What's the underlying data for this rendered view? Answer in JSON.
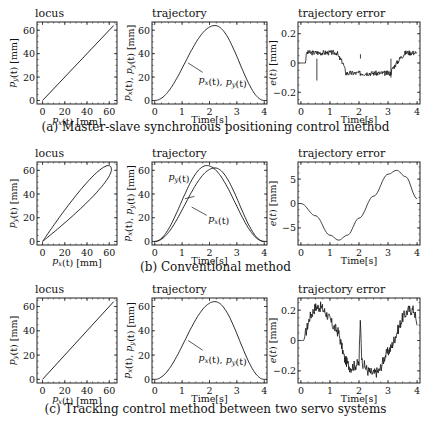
{
  "chart_data": [
    {
      "row": "a",
      "caption": "(a) Master-slave synchronous positioning control method",
      "panels": [
        {
          "type": "line",
          "title": "locus",
          "xlabel": "p_x(t) [mm]",
          "ylabel": "p_y(t) [mm]",
          "xlim": [
            -5,
            67
          ],
          "ylim": [
            -3,
            67
          ],
          "xticks": [
            0,
            20,
            40,
            60
          ],
          "yticks": [
            0,
            20,
            40,
            60
          ],
          "series": [
            {
              "name": "locus",
              "x": [
                0,
                64
              ],
              "y": [
                0,
                64
              ]
            }
          ]
        },
        {
          "type": "line",
          "title": "trajectory",
          "xlabel": "Time[s]",
          "ylabel": "p_x(t), p_y(t) [mm]",
          "xlim": [
            -0.1,
            4.1
          ],
          "ylim": [
            -3,
            67
          ],
          "xticks": [
            0,
            1,
            2,
            3,
            4
          ],
          "yticks": [
            0,
            20,
            40,
            60
          ],
          "annotation": "p_x(t), p_y(t)",
          "series": [
            {
              "name": "p_x(t), p_y(t)",
              "peak_time": 2.2,
              "peak_value": 64
            }
          ]
        },
        {
          "type": "line",
          "title": "trajectory error",
          "xlabel": "Time[s]",
          "ylabel": "e(t) [mm]",
          "xlim": [
            -0.1,
            4.1
          ],
          "ylim": [
            -0.28,
            0.28
          ],
          "xticks": [
            0,
            1,
            2,
            3,
            4
          ],
          "yticks": [
            -0.2,
            0,
            0.2
          ],
          "series": [
            {
              "name": "e(t)",
              "x": [
                0,
                0.15,
                0.2,
                1.25,
                1.3,
                1.45,
                1.55,
                3.1,
                3.15,
                3.3,
                3.45,
                3.6,
                4.0
              ],
              "y": [
                0,
                0,
                0.07,
                0.07,
                0.04,
                0,
                -0.07,
                -0.07,
                -0.04,
                0,
                0.04,
                0.07,
                0.07
              ]
            }
          ]
        }
      ]
    },
    {
      "row": "b",
      "caption": "(b) Conventional method",
      "panels": [
        {
          "type": "line",
          "title": "locus",
          "xlabel": "p_x(t) [mm]",
          "ylabel": "p_y(t) [mm]",
          "xlim": [
            -5,
            67
          ],
          "ylim": [
            -3,
            67
          ],
          "xticks": [
            0,
            20,
            40,
            60
          ],
          "yticks": [
            0,
            20,
            40,
            60
          ],
          "series": [
            {
              "name": "locus (ellipse loop)",
              "x": [
                0,
                64
              ],
              "y": [
                0,
                64
              ]
            }
          ]
        },
        {
          "type": "line",
          "title": "trajectory",
          "xlabel": "Time[s]",
          "ylabel": "p_x(t), p_y(t) [mm]",
          "xlim": [
            -0.1,
            4.1
          ],
          "ylim": [
            -3,
            67
          ],
          "xticks": [
            0,
            1,
            2,
            3,
            4
          ],
          "yticks": [
            0,
            20,
            40,
            60
          ],
          "annotations": [
            "p_y(t)",
            "p_x(t)"
          ],
          "series": [
            {
              "name": "p_y(t)",
              "peak_time": 1.9,
              "peak_value": 64
            },
            {
              "name": "p_x(t)",
              "peak_time": 2.2,
              "peak_value": 62
            }
          ]
        },
        {
          "type": "line",
          "title": "trajectory error",
          "xlabel": "Time[s]",
          "ylabel": "e(t) [mm]",
          "xlim": [
            -0.1,
            4.1
          ],
          "ylim": [
            -8.5,
            8.5
          ],
          "xticks": [
            0,
            1,
            2,
            3,
            4
          ],
          "yticks": [
            -5,
            0,
            5
          ],
          "series": [
            {
              "name": "e(t)",
              "x": [
                0,
                0.5,
                1.0,
                1.3,
                1.6,
                2.0,
                2.5,
                3.0,
                3.3,
                3.6,
                4.0
              ],
              "y": [
                0,
                -2.5,
                -6.5,
                -7.5,
                -6.5,
                -3,
                1.5,
                6,
                6.8,
                5.5,
                1
              ]
            }
          ]
        }
      ]
    },
    {
      "row": "c",
      "caption": "(c) Tracking control method between two servo systems",
      "panels": [
        {
          "type": "line",
          "title": "locus",
          "xlabel": "p_x(t) [mm]",
          "ylabel": "p_y(t) [mm]",
          "xlim": [
            -5,
            67
          ],
          "ylim": [
            -3,
            67
          ],
          "xticks": [
            0,
            20,
            40,
            60
          ],
          "yticks": [
            0,
            20,
            40,
            60
          ],
          "series": [
            {
              "name": "locus",
              "x": [
                0,
                64
              ],
              "y": [
                0,
                64
              ]
            }
          ]
        },
        {
          "type": "line",
          "title": "trajectory",
          "xlabel": "Time[s]",
          "ylabel": "p_x(t), p_y(t) [mm]",
          "xlim": [
            -0.1,
            4.1
          ],
          "ylim": [
            -3,
            67
          ],
          "xticks": [
            0,
            1,
            2,
            3,
            4
          ],
          "yticks": [
            0,
            20,
            40,
            60
          ],
          "annotation": "p_x(t), p_y(t)",
          "series": [
            {
              "name": "p_x(t), p_y(t)",
              "peak_time": 2.2,
              "peak_value": 64
            }
          ]
        },
        {
          "type": "line",
          "title": "trajectory error",
          "xlabel": "Time[s]",
          "ylabel": "e(t) [mm]",
          "xlim": [
            -0.1,
            4.1
          ],
          "ylim": [
            -0.28,
            0.28
          ],
          "xticks": [
            0,
            1,
            2,
            3,
            4
          ],
          "yticks": [
            -0.2,
            0,
            0.2
          ],
          "series": [
            {
              "name": "e(t)",
              "x": [
                0,
                0.1,
                0.3,
                0.5,
                0.7,
                0.9,
                1.1,
                1.3,
                1.5,
                1.7,
                2.0,
                2.05,
                2.1,
                2.3,
                2.5,
                2.7,
                2.9,
                3.1,
                3.3,
                3.5,
                3.7,
                3.9,
                4.0
              ],
              "y": [
                0,
                0,
                0.15,
                0.22,
                0.22,
                0.17,
                0.1,
                0.05,
                -0.12,
                -0.18,
                -0.15,
                0.15,
                -0.14,
                -0.2,
                -0.22,
                -0.2,
                -0.1,
                -0.05,
                0.05,
                0.15,
                0.2,
                0.2,
                0.1
              ]
            }
          ]
        }
      ]
    }
  ],
  "labels": {
    "locus": "locus",
    "trajectory": "trajectory",
    "trajectory_error": "trajectory error",
    "time": "Time[s]",
    "px_mm": "p_x(t) [mm]",
    "py_mm": "p_y(t) [mm]",
    "pxpy_mm": "p_x(t), p_y(t) [mm]",
    "e_mm": "e(t) [mm]",
    "ann_pxpy": "p_x(t), p_y(t)",
    "ann_px": "p_x(t)",
    "ann_py": "p_y(t)"
  },
  "ticks": {
    "mm": [
      "0",
      "20",
      "40",
      "60"
    ],
    "time": [
      "0",
      "1",
      "2",
      "3",
      "4"
    ],
    "err_small": [
      "0.2",
      "0",
      "−0.2"
    ],
    "err_large": [
      "5",
      "0",
      "−5"
    ]
  },
  "captions": {
    "a": "(a) Master-slave synchronous positioning control method",
    "b": "(b) Conventional method",
    "c": "(c) Tracking control method between two servo systems"
  }
}
